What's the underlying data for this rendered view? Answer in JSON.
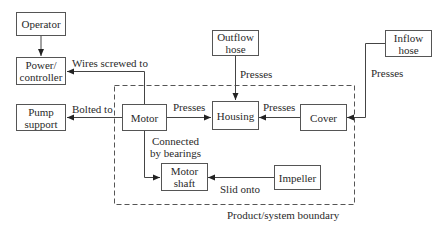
{
  "diagram": {
    "boundary_label": "Product/system boundary",
    "nodes": {
      "operator": "Operator",
      "power_controller": "Power/\ncontroller",
      "pump_support": "Pump\nsupport",
      "motor": "Motor",
      "housing": "Housing",
      "cover": "Cover",
      "outflow_hose": "Outflow\nhose",
      "inflow_hose": "Inflow\nhose",
      "motor_shaft": "Motor\nshaft",
      "impeller": "Impeller"
    },
    "edges": {
      "operator_to_power": "",
      "motor_to_power": "Wires screwed to",
      "motor_to_pump_support": "Bolted to",
      "motor_to_housing": "Presses",
      "outflow_to_housing": "Presses",
      "cover_to_housing": "Presses",
      "inflow_to_cover": "Presses",
      "motor_to_shaft": "Connected\nby bearings",
      "impeller_to_shaft": "Slid onto"
    }
  }
}
